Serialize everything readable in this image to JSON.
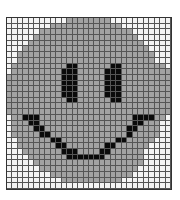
{
  "figure": {
    "title": "",
    "cols": 30,
    "rows": 30,
    "palette": {
      "w": "#f4f4f4",
      "g": "#a2a2a2",
      "b": "#0a0a0a"
    },
    "cells": [
      "wwwwwwwwwwwggggggggwwwwwwwwwww",
      "wwwwwwwwgggggggggggggwwwwwwwww",
      "wwwwwwgggggggggggggggggwwwwwww",
      "wwwwwgggggggggggggggggggwwwwww",
      "wwwwgggggggggggggggggggggwwwww",
      "wwwgggggggggggggggggggggggwwww",
      "wwgggggggggggggggggggggggggwww",
      "wwgggggggggggggggggggggggggwww",
      "wggggggggggbbggggggbbggggggggw",
      "wgggggggggbbbgggggbbbgggggggggw",
      "ggggggggggbbbgggggbbbggggggggg",
      "ggggggggggbbbgggggbbbggggggggg",
      "ggggggggggbbbgggggbbbggggggggg",
      "ggggggggggbbbgggggbbbggggggggg",
      "gggggggggggbbggggggbbggggggggg",
      "gggggggggggggggggggggggggggggg",
      "gggggggggggggggggggggggggggggg",
      "wggbbbgggggggggggggggggbbbbggw",
      "wgggbbgggggggggggggggggbbgggw",
      "wggggbbgggggggggggggggbbggggw",
      "wgggggbbggggggggggggggbgggggw",
      "wwggggggbbggggggggggbbgggggww",
      "wwgggggggbbgggggggbbggggggwww",
      "wwwgggggggbbbggggbbggggggwwww",
      "wwwwgggggggbbbbbbbgggggggwwww",
      "wwwwwggggggggggggggggggggwwwww",
      "wwwwwwggggggggggggggggggwwwwww",
      "wwwwwwwwgggggggggggggggwwwwwww",
      "wwwwwwwwwwgggggggggggwwwwwwwww",
      "wwwwwwwwwwwwwwwwwwwwwwwwwwwwww"
    ]
  }
}
